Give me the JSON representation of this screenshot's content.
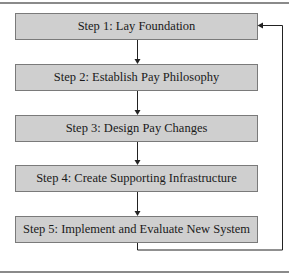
{
  "diagram": {
    "steps": [
      {
        "label": "Step 1: Lay Foundation"
      },
      {
        "label": "Step 2: Establish Pay Philosophy"
      },
      {
        "label": "Step 3: Design Pay Changes"
      },
      {
        "label": "Step 4: Create Supporting Infrastructure"
      },
      {
        "label": "Step 5: Implement and Evaluate New System"
      }
    ],
    "colors": {
      "box_fill": "#cfcfcf",
      "box_border": "#7a7a7a",
      "line": "#222222"
    }
  }
}
